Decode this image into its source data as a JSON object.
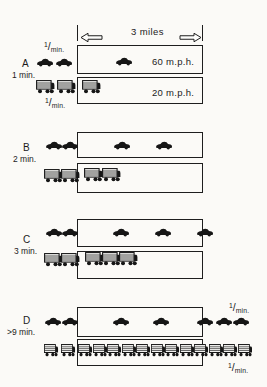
{
  "header": {
    "distance_label": "3 miles"
  },
  "fraction_label": {
    "numerator": "1",
    "slash": "/",
    "denominator": "min."
  },
  "road": {
    "length_miles": 3,
    "car_speed_mph": 60,
    "truck_speed_mph": 20,
    "entry_rate_per_min": 1
  },
  "sections": [
    {
      "letter": "A",
      "time_label": "1 min.",
      "car_lane": {
        "x": 77,
        "y": 45,
        "w": 126,
        "h": 29,
        "speed_label": "60 m.p.h."
      },
      "truck_lane": {
        "x": 77,
        "y": 77,
        "w": 126,
        "h": 27,
        "speed_label": "20 m.p.h."
      },
      "cars": [
        [
          36,
          57
        ],
        [
          55,
          57
        ],
        [
          115,
          56
        ]
      ],
      "trucks": [
        [
          36,
          80
        ],
        [
          57,
          80
        ],
        [
          82,
          80
        ]
      ],
      "truck_w": 19,
      "truck_h": 15
    },
    {
      "letter": "B",
      "time_label": "2 min.",
      "car_lane": {
        "x": 77,
        "y": 132,
        "w": 126,
        "h": 26,
        "speed_label": ""
      },
      "truck_lane": {
        "x": 77,
        "y": 163,
        "w": 126,
        "h": 30,
        "speed_label": ""
      },
      "cars": [
        [
          45,
          140
        ],
        [
          61,
          140
        ],
        [
          113,
          140
        ],
        [
          155,
          140
        ]
      ],
      "trucks": [
        [
          44,
          169
        ],
        [
          61,
          169
        ],
        [
          84,
          168
        ],
        [
          102,
          168
        ]
      ],
      "truck_w": 19,
      "truck_h": 15
    },
    {
      "letter": "C",
      "time_label": "3 min.",
      "car_lane": {
        "x": 77,
        "y": 219,
        "w": 126,
        "h": 28,
        "speed_label": ""
      },
      "truck_lane": {
        "x": 77,
        "y": 251,
        "w": 126,
        "h": 28,
        "speed_label": ""
      },
      "cars": [
        [
          45,
          227
        ],
        [
          61,
          227
        ],
        [
          112,
          227
        ],
        [
          154,
          227
        ],
        [
          196,
          227
        ]
      ],
      "trucks": [
        [
          44,
          253
        ],
        [
          61,
          253
        ],
        [
          85,
          252
        ],
        [
          102,
          252
        ],
        [
          119,
          252
        ]
      ],
      "truck_w": 19,
      "truck_h": 15
    },
    {
      "letter": "D",
      "time_label": ">9 min.",
      "car_lane": {
        "x": 77,
        "y": 307,
        "w": 126,
        "h": 30,
        "speed_label": ""
      },
      "truck_lane": {
        "x": 77,
        "y": 339,
        "w": 126,
        "h": 27,
        "speed_label": ""
      },
      "cars": [
        [
          44,
          316
        ],
        [
          61,
          316
        ],
        [
          112,
          316
        ],
        [
          152,
          316
        ],
        [
          196,
          316
        ],
        [
          215,
          316
        ],
        [
          232,
          316
        ]
      ],
      "trucks": [
        [
          44,
          344
        ],
        [
          61,
          344
        ],
        [
          78,
          344
        ],
        [
          92.5,
          344
        ],
        [
          107,
          344
        ],
        [
          121.5,
          344
        ],
        [
          136,
          344
        ],
        [
          150.5,
          344
        ],
        [
          165,
          344
        ],
        [
          179.5,
          344
        ],
        [
          194,
          344
        ],
        [
          208.5,
          344
        ],
        [
          223,
          344
        ],
        [
          237.5,
          344
        ]
      ],
      "truck_w": 14.5,
      "truck_h": 14
    }
  ]
}
